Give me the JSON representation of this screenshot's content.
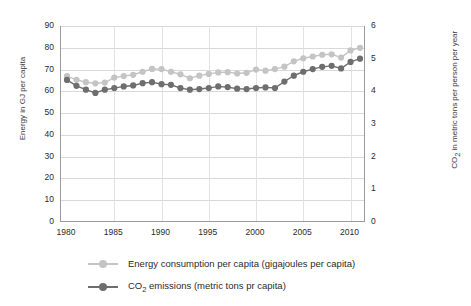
{
  "chart_data": {
    "type": "line",
    "title": "",
    "xlabel": "",
    "ylabel": "Energy in GJ per capita",
    "y2label": "CO2 in metric tons per person per year",
    "x": [
      1980,
      1981,
      1982,
      1983,
      1984,
      1985,
      1986,
      1987,
      1988,
      1989,
      1990,
      1991,
      1992,
      1993,
      1994,
      1995,
      1996,
      1997,
      1998,
      1999,
      2000,
      2001,
      2002,
      2003,
      2004,
      2005,
      2006,
      2007,
      2008,
      2009,
      2010,
      2011
    ],
    "xticks": [
      1980,
      1985,
      1990,
      1995,
      2000,
      2005,
      2010
    ],
    "yticks_left": [
      0,
      10,
      20,
      30,
      40,
      50,
      60,
      70,
      80,
      90
    ],
    "yticks_right": [
      0,
      1,
      2,
      3,
      4,
      5,
      6
    ],
    "ylim": [
      0,
      90
    ],
    "y2lim": [
      0,
      6
    ],
    "grid": true,
    "legend_position": "bottom",
    "series": [
      {
        "name": "Energy consumption per capita (gigajoules per capita)",
        "axis": "left",
        "color": "#c4c4c4",
        "marker": "circle",
        "values": [
          67.0,
          65.3,
          64.2,
          63.7,
          64.0,
          66.3,
          67.0,
          67.6,
          69.0,
          70.3,
          70.2,
          69.0,
          67.8,
          66.0,
          67.2,
          68.0,
          68.7,
          68.8,
          68.2,
          68.5,
          70.0,
          69.5,
          70.2,
          71.3,
          73.8,
          75.2,
          76.0,
          76.8,
          77.0,
          75.5,
          78.8,
          80.0
        ]
      },
      {
        "name": "CO2 emissions (metric tons pr capita)",
        "axis": "right",
        "color": "#6e6e6e",
        "marker": "circle",
        "values": [
          4.35,
          4.17,
          4.05,
          3.95,
          4.05,
          4.1,
          4.15,
          4.18,
          4.25,
          4.28,
          4.22,
          4.2,
          4.1,
          4.05,
          4.07,
          4.1,
          4.15,
          4.13,
          4.08,
          4.07,
          4.1,
          4.12,
          4.1,
          4.3,
          4.48,
          4.6,
          4.68,
          4.75,
          4.78,
          4.7,
          4.9,
          5.0
        ]
      }
    ]
  },
  "legend": {
    "entries": [
      {
        "label_pre": "Energy consumption per capita (gigajoules per capita)",
        "label_sub": "",
        "label_post": ""
      },
      {
        "label_pre": "CO",
        "label_sub": "2",
        "label_post": " emissions (metric tons pr capita)"
      }
    ]
  },
  "axes": {
    "left_title": "Energy in GJ per capita",
    "right_title_pre": "CO",
    "right_title_sub": "2",
    "right_title_post": " in metric tons per person per year"
  },
  "colors": {
    "energy": "#c4c4c4",
    "co2": "#6e6e6e",
    "grid": "#d9d9d9",
    "axis": "#9a9a9a",
    "text": "#2b2b2b"
  }
}
